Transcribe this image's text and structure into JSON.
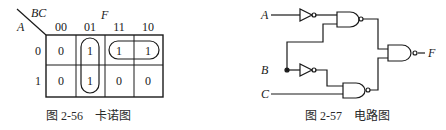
{
  "kmap": {
    "title_var": "F",
    "row_var": "A",
    "col_var": "BC",
    "col_headers": [
      "00",
      "01",
      "11",
      "10"
    ],
    "row_headers": [
      "0",
      "1"
    ],
    "cells": [
      [
        "0",
        "1",
        "1",
        "1"
      ],
      [
        "0",
        "1",
        "0",
        "0"
      ]
    ],
    "groups": [
      "column 01 (rows 0-1)",
      "row 0 columns 11-10"
    ],
    "caption": "图 2-56    卡诺图"
  },
  "circuit": {
    "inputs": [
      "A",
      "B",
      "C"
    ],
    "output": "F",
    "caption": "图 2-57    电路图"
  }
}
